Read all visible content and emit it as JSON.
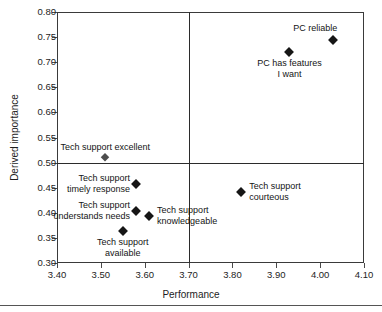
{
  "chart_data": {
    "type": "scatter",
    "title": "",
    "xlabel": "Performance",
    "ylabel": "Derived importance",
    "xlim": [
      3.4,
      4.1
    ],
    "ylim": [
      0.3,
      0.8
    ],
    "xticks": [
      "3.40",
      "3.50",
      "3.60",
      "3.70",
      "3.80",
      "3.90",
      "4.00",
      "4.10"
    ],
    "yticks": [
      "0.30",
      "0.35",
      "0.40",
      "0.45",
      "0.50",
      "0.55",
      "0.60",
      "0.65",
      "0.70",
      "0.75",
      "0.80"
    ],
    "grid": false,
    "legend": "none",
    "reference_lines": {
      "vertical_x": 3.7,
      "horizontal_y": 0.5
    },
    "points": [
      {
        "label": "PC reliable",
        "x": 4.03,
        "y": 0.745,
        "label_pos": "above-left",
        "lines": [
          "PC reliable"
        ]
      },
      {
        "label": "PC has features I want",
        "x": 3.93,
        "y": 0.72,
        "label_pos": "below",
        "lines": [
          "PC has features",
          "I want"
        ]
      },
      {
        "label": "Tech support excellent",
        "x": 3.51,
        "y": 0.511,
        "label_pos": "above",
        "lines": [
          "Tech support excellent"
        ]
      },
      {
        "label": "Tech support timely response",
        "x": 3.58,
        "y": 0.458,
        "label_pos": "left",
        "lines": [
          "Tech support",
          "timely response"
        ]
      },
      {
        "label": "Tech support courteous",
        "x": 3.82,
        "y": 0.442,
        "label_pos": "right",
        "lines": [
          "Tech support",
          "courteous"
        ]
      },
      {
        "label": "Tech support understands needs",
        "x": 3.58,
        "y": 0.404,
        "label_pos": "left",
        "lines": [
          "Tech support",
          "understands needs"
        ]
      },
      {
        "label": "Tech support knowledgeable",
        "x": 3.61,
        "y": 0.394,
        "label_pos": "right",
        "lines": [
          "Tech support",
          "knowledgeable"
        ]
      },
      {
        "label": "Tech support available",
        "x": 3.55,
        "y": 0.363,
        "label_pos": "below",
        "lines": [
          "Tech support",
          "available"
        ]
      }
    ],
    "marker_color": "#161616",
    "axis_color": "#3a3a3a",
    "reference_line_color": "#2b2b2b"
  },
  "axis": {
    "x_title": "Performance",
    "y_title": "Derived importance",
    "x_ticks": [
      "3.40",
      "3.50",
      "3.60",
      "3.70",
      "3.80",
      "3.90",
      "4.00",
      "4.10"
    ],
    "y_ticks": [
      "0.30",
      "0.35",
      "0.40",
      "0.45",
      "0.50",
      "0.55",
      "0.60",
      "0.65",
      "0.70",
      "0.75",
      "0.80"
    ]
  },
  "labels": {
    "pc_reliable": "PC reliable",
    "pc_features_l1": "PC has features",
    "pc_features_l2": "I want",
    "ts_excellent": "Tech support excellent",
    "ts_timely_l1": "Tech support",
    "ts_timely_l2": "timely response",
    "ts_courteous_l1": "Tech support",
    "ts_courteous_l2": "courteous",
    "ts_understands_l1": "Tech support",
    "ts_understands_l2": "understands needs",
    "ts_knowledge_l1": "Tech support",
    "ts_knowledge_l2": "knowledgeable",
    "ts_available_l1": "Tech support",
    "ts_available_l2": "available"
  }
}
